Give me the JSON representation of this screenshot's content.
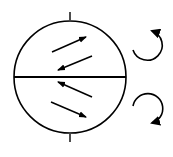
{
  "diagram": {
    "stroke_color": "#000000",
    "background": "#ffffff",
    "circle": {
      "cx": 70,
      "cy": 77,
      "r": 56
    },
    "upper_half": {
      "arrows": [
        {
          "direction": "up-right",
          "from": [
            52,
            52
          ],
          "to": [
            86,
            37
          ]
        },
        {
          "direction": "down-left",
          "from": [
            92,
            56
          ],
          "to": [
            58,
            70
          ]
        }
      ],
      "rotation": "counter-clockwise"
    },
    "lower_half": {
      "arrows": [
        {
          "direction": "up-left",
          "from": [
            92,
            97
          ],
          "to": [
            58,
            82
          ]
        },
        {
          "direction": "down-right",
          "from": [
            51,
            102
          ],
          "to": [
            86,
            117
          ]
        }
      ],
      "rotation": "clockwise"
    }
  }
}
